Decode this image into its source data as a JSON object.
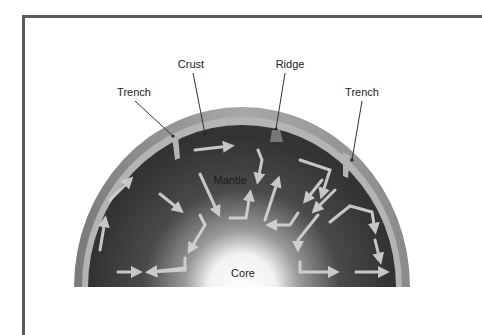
{
  "diagram": {
    "labels": {
      "crust": "Crust",
      "ridge": "Ridge",
      "trench_left": "Trench",
      "trench_right": "Trench",
      "mantle": "Mantle",
      "core": "Core"
    },
    "colors": {
      "frame": "#5a5a5a",
      "crust_outer": "#8c8c8c",
      "crust_inner": "#b8b8b8",
      "mantle": "#3a3a3a",
      "core_glow": "#ffffff",
      "arrows": "#d6d6d6",
      "leader_lines": "#333333"
    }
  }
}
